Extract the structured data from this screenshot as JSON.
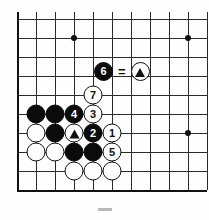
{
  "figure": {
    "name": "go-board-diagram",
    "type": "go-problem-diagram",
    "board": {
      "columns": 10,
      "rows": 10,
      "origin_x": 17,
      "origin_y": 19,
      "cell": 19,
      "edges": [
        "left",
        "bottom"
      ],
      "star_points": [
        {
          "col": 3,
          "row": 1,
          "name": "star-point-top-left"
        },
        {
          "col": 9,
          "row": 1,
          "name": "star-point-top-right"
        },
        {
          "col": 9,
          "row": 6,
          "name": "star-point-right"
        }
      ]
    },
    "stones": [
      {
        "col": 1,
        "row": 5,
        "color": "black",
        "label": "",
        "mark": "",
        "name": "stone-black-a5"
      },
      {
        "col": 2,
        "row": 5,
        "color": "black",
        "label": "",
        "mark": "",
        "name": "stone-black-b5"
      },
      {
        "col": 3,
        "row": 5,
        "color": "black",
        "label": "4",
        "mark": "",
        "name": "stone-black-move-4"
      },
      {
        "col": 4,
        "row": 5,
        "color": "white",
        "label": "3",
        "mark": "",
        "name": "stone-white-move-3"
      },
      {
        "col": 1,
        "row": 6,
        "color": "white",
        "label": "",
        "mark": "",
        "name": "stone-white-a6"
      },
      {
        "col": 2,
        "row": 6,
        "color": "black",
        "label": "",
        "mark": "",
        "name": "stone-black-b6"
      },
      {
        "col": 3,
        "row": 6,
        "color": "white",
        "label": "",
        "mark": "triangle",
        "name": "stone-white-triangle"
      },
      {
        "col": 4,
        "row": 6,
        "color": "black",
        "label": "2",
        "mark": "",
        "name": "stone-black-move-2"
      },
      {
        "col": 5,
        "row": 6,
        "color": "white",
        "label": "1",
        "mark": "",
        "name": "stone-white-move-1"
      },
      {
        "col": 1,
        "row": 7,
        "color": "white",
        "label": "",
        "mark": "",
        "name": "stone-white-a7"
      },
      {
        "col": 2,
        "row": 7,
        "color": "white",
        "label": "",
        "mark": "",
        "name": "stone-white-b7"
      },
      {
        "col": 3,
        "row": 7,
        "color": "black",
        "label": "",
        "mark": "",
        "name": "stone-black-c7"
      },
      {
        "col": 4,
        "row": 7,
        "color": "black",
        "label": "",
        "mark": "",
        "name": "stone-black-d7"
      },
      {
        "col": 5,
        "row": 7,
        "color": "white",
        "label": "5",
        "mark": "",
        "name": "stone-white-move-5"
      },
      {
        "col": 3,
        "row": 8,
        "color": "white",
        "label": "",
        "mark": "",
        "name": "stone-white-c8"
      },
      {
        "col": 4,
        "row": 8,
        "color": "white",
        "label": "",
        "mark": "",
        "name": "stone-white-d8"
      },
      {
        "col": 5,
        "row": 8,
        "color": "white",
        "label": "",
        "mark": "",
        "name": "stone-white-e8"
      },
      {
        "col": 4,
        "row": 4,
        "color": "white",
        "label": "7",
        "mark": "",
        "name": "stone-white-move-7"
      }
    ],
    "legend": {
      "x": 94,
      "y": 62,
      "move_stone": {
        "color": "black",
        "label": "6",
        "name": "legend-stone-move-6"
      },
      "equals": "=",
      "ref_stone": {
        "color": "white",
        "label": "",
        "mark": "triangle",
        "name": "legend-stone-triangle"
      }
    }
  }
}
